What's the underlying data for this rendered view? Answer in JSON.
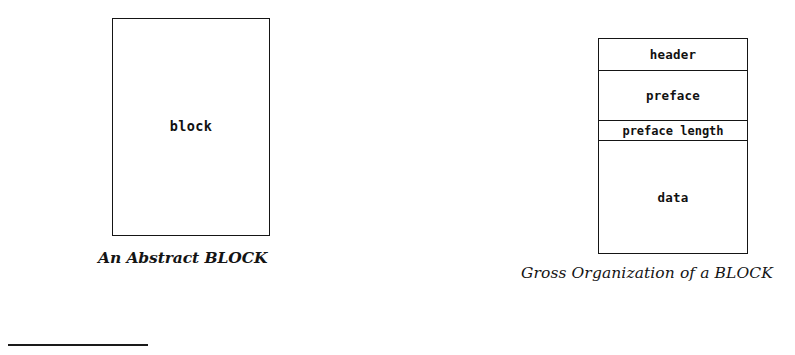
{
  "page": {
    "background_color": "#ffffff",
    "ink_color": "#141414"
  },
  "figures": [
    {
      "id": "abstract-block",
      "caption": "An Abstract BLOCK",
      "box": {
        "label": "block"
      }
    },
    {
      "id": "gross-organization",
      "caption": "Gross Organization of a BLOCK",
      "bands": [
        {
          "label": "header"
        },
        {
          "label": "preface"
        },
        {
          "label": "preface length"
        },
        {
          "label": "data"
        }
      ]
    }
  ],
  "footnote_rule": {
    "present": true
  }
}
